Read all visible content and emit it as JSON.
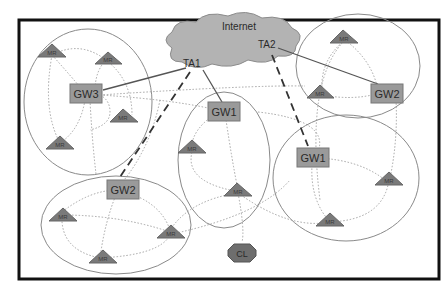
{
  "diagram": {
    "type": "network-topology",
    "cloud": {
      "label": "Internet",
      "agents": [
        {
          "id": "TA1",
          "label": "TA1"
        },
        {
          "id": "TA2",
          "label": "TA2"
        }
      ]
    },
    "gateways": [
      {
        "id": "gw3",
        "label": "GW3"
      },
      {
        "id": "gw1a",
        "label": "GW1"
      },
      {
        "id": "gw2a",
        "label": "GW2"
      },
      {
        "id": "gw1b",
        "label": "GW1"
      },
      {
        "id": "gw2b",
        "label": "GW2"
      }
    ],
    "mesh_router_label": "MR",
    "client": {
      "label": "CL"
    },
    "edges": {
      "solid": [
        "TA1-GW3",
        "TA1-GW1(center)",
        "TA2-GW2(top-right)"
      ],
      "dashed": [
        "TA1-GW2(bottom-left)",
        "TA2-GW1(right)"
      ]
    },
    "colors": {
      "cloud": "#b3b3b3",
      "gateway": "#9a9a9a",
      "router": "#7a7a7a",
      "client": "#6e6e6e",
      "frame": "#111111",
      "ellipse": "#8a8a8a"
    }
  }
}
